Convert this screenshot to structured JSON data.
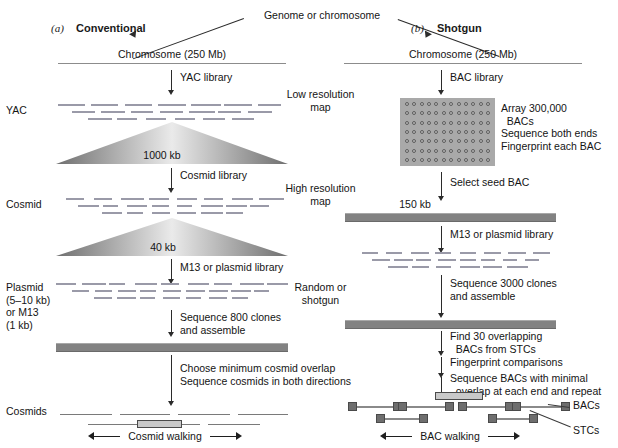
{
  "figure": {
    "top_label": "Genome or chromosome",
    "panels": [
      {
        "letter": "(a)",
        "title": "Conventional"
      },
      {
        "letter": "(b)",
        "title": "Shotgun"
      }
    ]
  },
  "center_labels": [
    "Low resolution\nmap",
    "High resolution\nmap",
    "Random or\nshotgun"
  ],
  "conventional": {
    "chromosome_label": "Chromosome (250 Mb)",
    "step1_arrow_label": "YAC library",
    "row1_label": "YAC",
    "triangle1_label": "1000 kb",
    "step2_arrow_label": "Cosmid library",
    "row2_label": "Cosmid",
    "triangle2_label": "40 kb",
    "step3_arrow_label": "M13 or plasmid library",
    "row3_label": "Plasmid\n(5–10 kb)\nor M13\n(1 kb)",
    "step4_arrow_label": "Sequence 800 clones\nand assemble",
    "step5_arrow_label": "Choose minimum cosmid overlap\nSequence cosmids in both directions",
    "row4_label": "Cosmids",
    "walking_label": "Cosmid walking"
  },
  "shotgun": {
    "chromosome_label": "Chromosome (250 Mb)",
    "step1_arrow_label": "BAC library",
    "array_annotation": "Array 300,000\n  BACs\nSequence both ends\nFingerprint each BAC",
    "array_columns": 12,
    "array_rows": 7,
    "step2_arrow_label": "Select seed BAC",
    "contig1_label": "150 kb",
    "step3_arrow_label": "M13 or plasmid library",
    "step4_arrow_label": "Sequence 3000 clones\nand assemble",
    "step5_arrow_label": "Find 30 overlapping\n  BACs from STCs",
    "step6_arrow_label": "Fingerprint comparisons",
    "step7_arrow_label": "Sequence BACs with minimal\n  overlap at each end and repeat",
    "legend_bacs": "BACs",
    "legend_stcs": "STCs",
    "walking_label": "BAC walking"
  },
  "colors": {
    "ink": "#141414",
    "rule": "#8c8c8c",
    "contig": "#828282",
    "clone_dash": "#9a9aa8",
    "array_bg": "#a9a9a9",
    "stc_fill": "#6e6e6e",
    "seed_fill": "#c9c9c9"
  }
}
